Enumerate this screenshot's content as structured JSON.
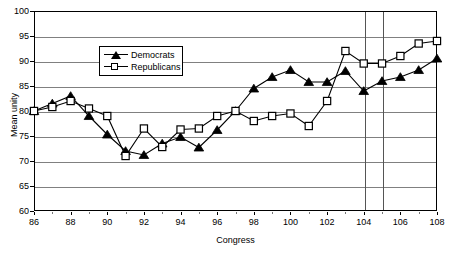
{
  "chart_data": {
    "type": "line",
    "title": "",
    "xlabel": "Congress",
    "ylabel": "Mean unity",
    "xlim": [
      86,
      108
    ],
    "ylim": [
      60,
      100
    ],
    "ytick_step": 5,
    "xtick_step": 2,
    "grid": true,
    "legend_position": "upper-center-left",
    "x": [
      86,
      87,
      88,
      89,
      90,
      91,
      92,
      93,
      94,
      95,
      96,
      97,
      98,
      99,
      100,
      101,
      102,
      103,
      104,
      105,
      106,
      107,
      108
    ],
    "xticks": [
      86,
      88,
      90,
      92,
      94,
      96,
      98,
      100,
      102,
      104,
      106,
      108
    ],
    "yticks": [
      60,
      65,
      70,
      75,
      80,
      85,
      90,
      95,
      100
    ],
    "series": [
      {
        "name": "Democrats",
        "marker": "filled-triangle",
        "color": "#000000",
        "values": [
          80.0,
          81.5,
          83.0,
          79.0,
          75.3,
          72.0,
          71.2,
          73.5,
          74.8,
          72.7,
          76.2,
          80.0,
          84.5,
          86.8,
          88.2,
          85.8,
          85.8,
          88.0,
          84.0,
          86.0,
          86.8,
          88.2,
          90.5
        ]
      },
      {
        "name": "Republicans",
        "marker": "open-square",
        "color": "#000000",
        "values": [
          80.0,
          80.8,
          82.0,
          80.5,
          79.0,
          71.0,
          76.5,
          72.8,
          76.3,
          76.5,
          79.0,
          80.0,
          78.0,
          79.0,
          79.5,
          77.0,
          82.0,
          92.0,
          89.5,
          89.5,
          91.0,
          93.5,
          94.0
        ]
      }
    ],
    "reference_lines": [
      {
        "x": 104
      },
      {
        "x": 105
      }
    ]
  },
  "legend": {
    "entries": [
      {
        "label": "Democrats"
      },
      {
        "label": "Republicans"
      }
    ]
  }
}
